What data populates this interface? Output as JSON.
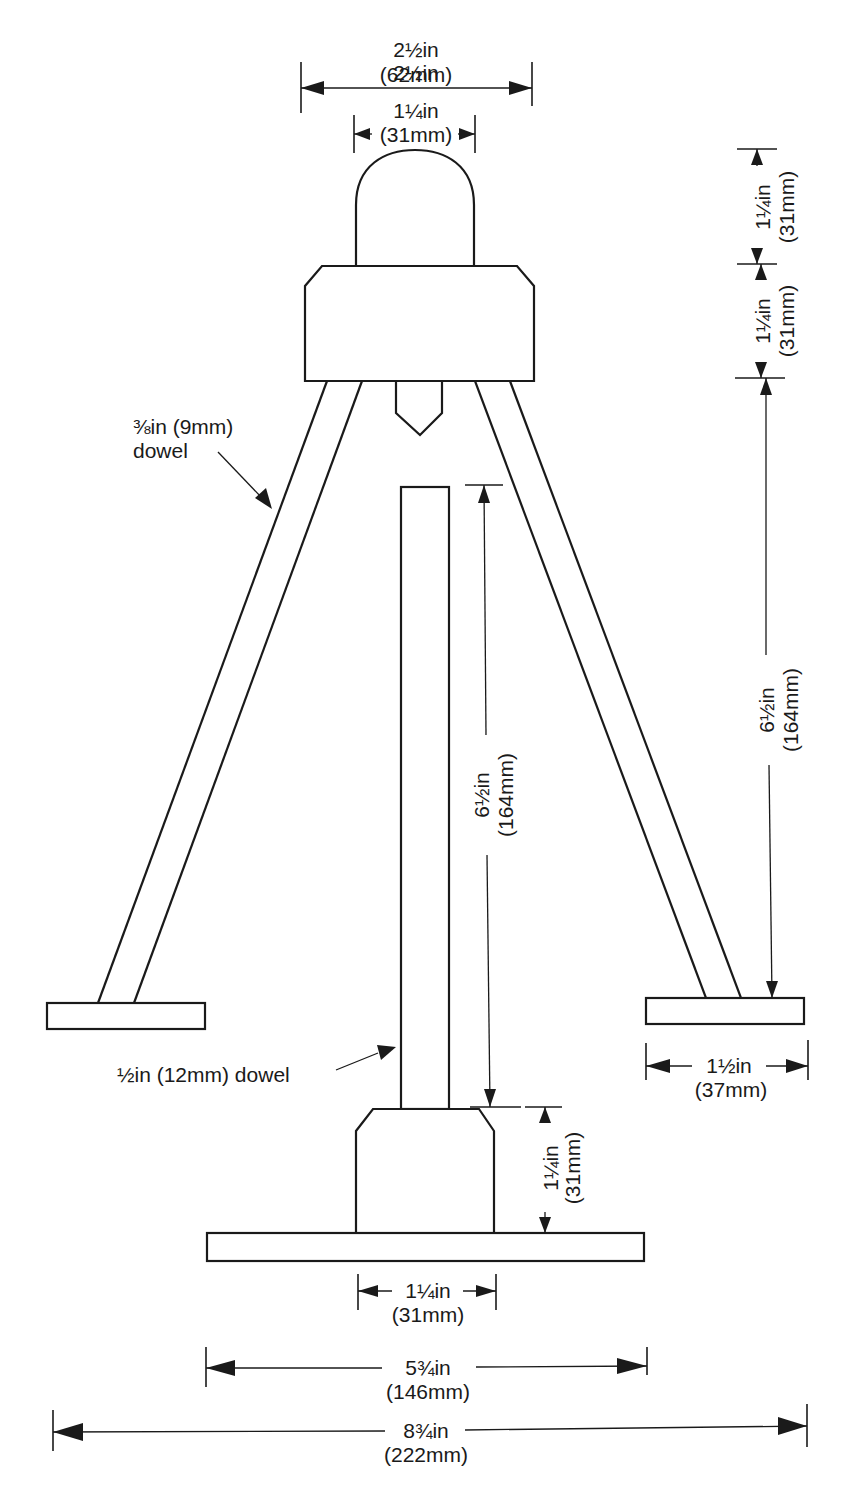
{
  "diagram": {
    "type": "technical-drawing",
    "line_color": "#1a1a1a",
    "background": "#ffffff"
  },
  "labels": {
    "leg_dowel": {
      "line1": "⅜in (9mm)",
      "line2": "dowel"
    },
    "center_dowel": "½in (12mm) dowel"
  },
  "dimensions": {
    "top_block_width": {
      "imperial": "2½in",
      "metric": "(62mm)"
    },
    "dome_width": {
      "imperial": "1¼in",
      "metric": "(31mm)"
    },
    "dome_height": {
      "imperial": "1¼in",
      "metric": "(31mm)"
    },
    "top_block_height": {
      "imperial": "1¼in",
      "metric": "(31mm)"
    },
    "leg_height": {
      "imperial": "6½in",
      "metric": "(164mm)"
    },
    "center_dowel_height": {
      "imperial": "6½in",
      "metric": "(164mm)"
    },
    "foot_width": {
      "imperial": "1½in",
      "metric": "(37mm)"
    },
    "base_block_height": {
      "imperial": "1¼in",
      "metric": "(31mm)"
    },
    "base_block_width": {
      "imperial": "1¼in",
      "metric": "(31mm)"
    },
    "base_plate_width": {
      "imperial": "5¾in",
      "metric": "(146mm)"
    },
    "overall_width": {
      "imperial": "8¾in",
      "metric": "(222mm)"
    }
  }
}
